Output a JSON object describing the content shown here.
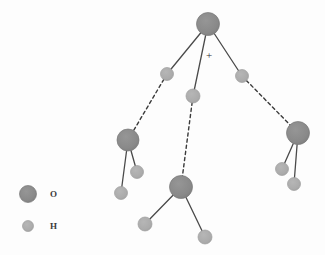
{
  "figure": {
    "width": 325,
    "height": 255,
    "background_color": "#fdfdfd"
  },
  "colors": {
    "oxygen": "#8a8a8a",
    "oxygen_edge": "#7a7a7a",
    "hydrogen": "#ababab",
    "hydrogen_edge": "#9d9d9d",
    "covalent_bond": "#4a4a4a",
    "hydrogen_bond": "#3a3a3a",
    "text": "#3a3a3a"
  },
  "charge": {
    "symbol": "+",
    "x": 209,
    "y": 55
  },
  "legend": {
    "items": [
      {
        "label": "O",
        "symbol_kind": "oxygen",
        "cx": 28,
        "cy": 194,
        "r": 8.5,
        "label_x": 50,
        "label_y": 194
      },
      {
        "label": "H",
        "symbol_kind": "hydrogen",
        "cx": 28,
        "cy": 226,
        "r": 5.5,
        "label_x": 50,
        "label_y": 226
      }
    ]
  },
  "atoms": [
    {
      "id": "O1",
      "element": "O",
      "x": 208,
      "y": 24,
      "r": 11.5,
      "group": "hydronium"
    },
    {
      "id": "H1",
      "element": "H",
      "x": 167,
      "y": 74,
      "r": 6.5,
      "group": "hydronium"
    },
    {
      "id": "H2",
      "element": "H",
      "x": 193,
      "y": 96,
      "r": 7.0,
      "group": "hydronium"
    },
    {
      "id": "H3",
      "element": "H",
      "x": 242,
      "y": 76,
      "r": 6.5,
      "group": "hydronium"
    },
    {
      "id": "O2",
      "element": "O",
      "x": 128,
      "y": 140,
      "r": 11.0,
      "group": "water-left"
    },
    {
      "id": "H4",
      "element": "H",
      "x": 137,
      "y": 172,
      "r": 6.5,
      "group": "water-left"
    },
    {
      "id": "H5",
      "element": "H",
      "x": 121,
      "y": 193,
      "r": 6.5,
      "group": "water-left"
    },
    {
      "id": "O3",
      "element": "O",
      "x": 181,
      "y": 187,
      "r": 11.5,
      "group": "water-bottom"
    },
    {
      "id": "H6",
      "element": "H",
      "x": 145,
      "y": 224,
      "r": 7.0,
      "group": "water-bottom"
    },
    {
      "id": "H7",
      "element": "H",
      "x": 205,
      "y": 237,
      "r": 7.0,
      "group": "water-bottom"
    },
    {
      "id": "O4",
      "element": "O",
      "x": 298,
      "y": 133,
      "r": 11.5,
      "group": "water-right"
    },
    {
      "id": "H8",
      "element": "H",
      "x": 282,
      "y": 169,
      "r": 6.5,
      "group": "water-right"
    },
    {
      "id": "H9",
      "element": "H",
      "x": 294,
      "y": 184,
      "r": 6.5,
      "group": "water-right"
    }
  ],
  "bonds": [
    {
      "from": "O1",
      "to": "H1",
      "kind": "covalent"
    },
    {
      "from": "O1",
      "to": "H2",
      "kind": "covalent"
    },
    {
      "from": "O1",
      "to": "H3",
      "kind": "covalent"
    },
    {
      "from": "O2",
      "to": "H4",
      "kind": "covalent"
    },
    {
      "from": "O2",
      "to": "H5",
      "kind": "covalent"
    },
    {
      "from": "O3",
      "to": "H6",
      "kind": "covalent"
    },
    {
      "from": "O3",
      "to": "H7",
      "kind": "covalent"
    },
    {
      "from": "O4",
      "to": "H8",
      "kind": "covalent"
    },
    {
      "from": "O4",
      "to": "H9",
      "kind": "covalent"
    },
    {
      "from": "H1",
      "to": "O2",
      "kind": "hydrogen"
    },
    {
      "from": "H2",
      "to": "O3",
      "kind": "hydrogen"
    },
    {
      "from": "H3",
      "to": "O4",
      "kind": "hydrogen"
    }
  ]
}
